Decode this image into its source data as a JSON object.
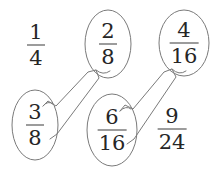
{
  "canvas": {
    "width": 216,
    "height": 169,
    "background_color": "#ffffff"
  },
  "style": {
    "text_color": "#262626",
    "outline_color": "#7a7a7a",
    "connector_color": "#7a7a7a",
    "bar_color": "#3a3a3a"
  },
  "diagram": {
    "type": "fraction-matching",
    "nodes": [
      {
        "id": "node-1-4",
        "numerator": "1",
        "denominator": "4",
        "circled": false,
        "row": "top",
        "column": 1,
        "cx": 36,
        "cy": 45
      },
      {
        "id": "node-2-8",
        "numerator": "2",
        "denominator": "8",
        "circled": true,
        "row": "top",
        "column": 2,
        "cx": 108,
        "cy": 44,
        "rx": 23,
        "ry": 34
      },
      {
        "id": "node-4-16",
        "numerator": "4",
        "denominator": "16",
        "circled": true,
        "row": "top",
        "column": 3,
        "cx": 184,
        "cy": 43,
        "rx": 25,
        "ry": 33
      },
      {
        "id": "node-3-8",
        "numerator": "3",
        "denominator": "8",
        "circled": true,
        "row": "bottom",
        "column": 1,
        "cx": 35,
        "cy": 125,
        "rx": 23,
        "ry": 35
      },
      {
        "id": "node-6-16",
        "numerator": "6",
        "denominator": "16",
        "circled": true,
        "row": "bottom",
        "column": 2,
        "cx": 112,
        "cy": 130,
        "rx": 25,
        "ry": 36
      },
      {
        "id": "node-9-24",
        "numerator": "9",
        "denominator": "24",
        "circled": false,
        "row": "bottom",
        "column": 3,
        "cx": 172,
        "cy": 129
      }
    ],
    "connectors": [
      {
        "id": "connector-3-8-to-2-8",
        "from": "node-3-8",
        "to": "node-2-8",
        "label": "3/8 matched with 2/8"
      },
      {
        "id": "connector-6-16-to-4-16",
        "from": "node-6-16",
        "to": "node-4-16",
        "label": "6/16 matched with 4/16"
      }
    ]
  }
}
